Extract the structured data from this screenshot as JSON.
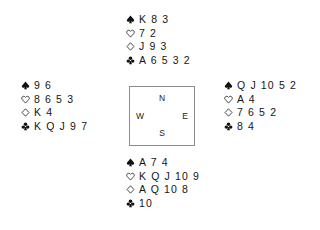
{
  "diagram": {
    "type": "bridge-deal",
    "background_color": "#ffffff",
    "text_color": "#151515",
    "border_color": "#8c8c8c"
  },
  "suits": {
    "spade": {
      "icon": "spade-icon",
      "label": "Spades",
      "fill": "solid",
      "color": "#111111"
    },
    "heart": {
      "icon": "heart-icon",
      "label": "Hearts",
      "fill": "outline",
      "color": "#111111"
    },
    "diamond": {
      "icon": "diamond-icon",
      "label": "Diamonds",
      "fill": "outline",
      "color": "#111111"
    },
    "club": {
      "icon": "club-icon",
      "label": "Clubs",
      "fill": "solid",
      "color": "#111111"
    }
  },
  "compass": {
    "north": "N",
    "west": "W",
    "east": "E",
    "south": "S"
  },
  "hands": {
    "north": {
      "position": "North",
      "spades": "K 8 3",
      "hearts": "7 2",
      "diamonds": "J 9 3",
      "clubs": "A 6 5 3 2"
    },
    "west": {
      "position": "West",
      "spades": "9 6",
      "hearts": "8 6 5 3",
      "diamonds": "K 4",
      "clubs": "K Q J 9 7"
    },
    "east": {
      "position": "East",
      "spades": "Q J 10 5 2",
      "hearts": "A 4",
      "diamonds": "7 6 5 2",
      "clubs": "8 4"
    },
    "south": {
      "position": "South",
      "spades": "A 7 4",
      "hearts": "K Q J 10 9",
      "diamonds": "A Q 10 8",
      "clubs": "10"
    }
  }
}
